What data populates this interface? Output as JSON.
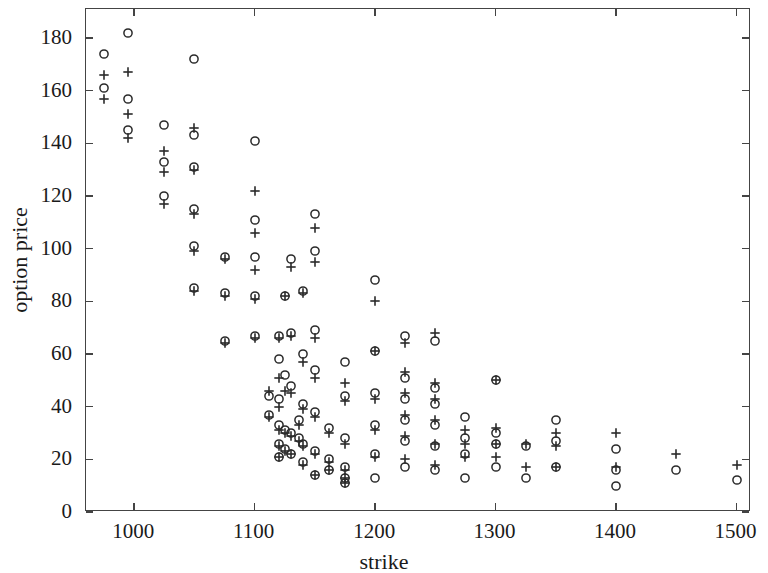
{
  "figure": {
    "background": "#ffffff",
    "axis_color": "#444444",
    "marker_color": "#2a2a2a"
  },
  "chart_data": {
    "type": "scatter",
    "title": "",
    "xlabel": "strike",
    "ylabel": "option price",
    "xlim": [
      960,
      1512
    ],
    "ylim": [
      0,
      191
    ],
    "xticks": [
      1000,
      1100,
      1200,
      1300,
      1400,
      1500
    ],
    "xticklabels": [
      "1000",
      "1100",
      "1200",
      "1300",
      "1400",
      "1500"
    ],
    "yticks": [
      0,
      20,
      40,
      60,
      80,
      100,
      120,
      140,
      160,
      180
    ],
    "yticklabels": [
      "0",
      "20",
      "40",
      "60",
      "80",
      "100",
      "120",
      "140",
      "160",
      "180"
    ],
    "grid": false,
    "legend": null,
    "legend_position": "none",
    "series": [
      {
        "name": "market price",
        "marker": "circle",
        "points": [
          [
            975,
            174
          ],
          [
            975,
            161
          ],
          [
            995,
            182
          ],
          [
            995,
            157
          ],
          [
            995,
            145
          ],
          [
            1025,
            147
          ],
          [
            1025,
            133
          ],
          [
            1025,
            120
          ],
          [
            1050,
            172
          ],
          [
            1050,
            143
          ],
          [
            1050,
            131
          ],
          [
            1050,
            115
          ],
          [
            1050,
            101
          ],
          [
            1050,
            85
          ],
          [
            1075,
            97
          ],
          [
            1075,
            83
          ],
          [
            1075,
            65
          ],
          [
            1100,
            141
          ],
          [
            1100,
            111
          ],
          [
            1100,
            97
          ],
          [
            1100,
            82
          ],
          [
            1100,
            67
          ],
          [
            1112,
            44
          ],
          [
            1112,
            37
          ],
          [
            1120,
            67
          ],
          [
            1120,
            58
          ],
          [
            1120,
            43
          ],
          [
            1120,
            33
          ],
          [
            1120,
            26
          ],
          [
            1120,
            21
          ],
          [
            1125,
            82
          ],
          [
            1125,
            52
          ],
          [
            1125,
            31
          ],
          [
            1125,
            24
          ],
          [
            1130,
            96
          ],
          [
            1130,
            68
          ],
          [
            1130,
            48
          ],
          [
            1130,
            30
          ],
          [
            1130,
            22
          ],
          [
            1137,
            35
          ],
          [
            1137,
            28
          ],
          [
            1140,
            84
          ],
          [
            1140,
            60
          ],
          [
            1140,
            41
          ],
          [
            1140,
            26
          ],
          [
            1140,
            19
          ],
          [
            1150,
            113
          ],
          [
            1150,
            99
          ],
          [
            1150,
            69
          ],
          [
            1150,
            54
          ],
          [
            1150,
            38
          ],
          [
            1150,
            23
          ],
          [
            1150,
            14
          ],
          [
            1162,
            32
          ],
          [
            1162,
            20
          ],
          [
            1162,
            16
          ],
          [
            1175,
            57
          ],
          [
            1175,
            44
          ],
          [
            1175,
            28
          ],
          [
            1175,
            17
          ],
          [
            1175,
            13
          ],
          [
            1175,
            11
          ],
          [
            1200,
            88
          ],
          [
            1200,
            61
          ],
          [
            1200,
            45
          ],
          [
            1200,
            33
          ],
          [
            1200,
            22
          ],
          [
            1200,
            13
          ],
          [
            1225,
            67
          ],
          [
            1225,
            51
          ],
          [
            1225,
            43
          ],
          [
            1225,
            35
          ],
          [
            1225,
            27
          ],
          [
            1225,
            17
          ],
          [
            1250,
            65
          ],
          [
            1250,
            47
          ],
          [
            1250,
            41
          ],
          [
            1250,
            33
          ],
          [
            1250,
            25
          ],
          [
            1250,
            16
          ],
          [
            1275,
            36
          ],
          [
            1275,
            28
          ],
          [
            1275,
            22
          ],
          [
            1275,
            13
          ],
          [
            1300,
            50
          ],
          [
            1300,
            30
          ],
          [
            1300,
            26
          ],
          [
            1300,
            17
          ],
          [
            1325,
            25
          ],
          [
            1325,
            13
          ],
          [
            1350,
            35
          ],
          [
            1350,
            27
          ],
          [
            1350,
            17
          ],
          [
            1400,
            24
          ],
          [
            1400,
            16
          ],
          [
            1400,
            10
          ],
          [
            1450,
            16
          ],
          [
            1500,
            12
          ]
        ]
      },
      {
        "name": "model price",
        "marker": "plus",
        "points": [
          [
            975,
            166
          ],
          [
            975,
            157
          ],
          [
            995,
            167
          ],
          [
            995,
            151
          ],
          [
            995,
            142
          ],
          [
            1025,
            137
          ],
          [
            1025,
            129
          ],
          [
            1025,
            117
          ],
          [
            1050,
            146
          ],
          [
            1050,
            130
          ],
          [
            1050,
            113
          ],
          [
            1050,
            99
          ],
          [
            1050,
            84
          ],
          [
            1075,
            96
          ],
          [
            1075,
            82
          ],
          [
            1075,
            64
          ],
          [
            1100,
            122
          ],
          [
            1100,
            106
          ],
          [
            1100,
            92
          ],
          [
            1100,
            81
          ],
          [
            1100,
            66
          ],
          [
            1112,
            46
          ],
          [
            1112,
            36
          ],
          [
            1120,
            66
          ],
          [
            1120,
            51
          ],
          [
            1120,
            40
          ],
          [
            1120,
            31
          ],
          [
            1120,
            25
          ],
          [
            1120,
            21
          ],
          [
            1125,
            82
          ],
          [
            1125,
            46
          ],
          [
            1125,
            30
          ],
          [
            1125,
            23
          ],
          [
            1130,
            93
          ],
          [
            1130,
            67
          ],
          [
            1130,
            45
          ],
          [
            1130,
            29
          ],
          [
            1130,
            22
          ],
          [
            1137,
            33
          ],
          [
            1137,
            27
          ],
          [
            1140,
            83
          ],
          [
            1140,
            57
          ],
          [
            1140,
            39
          ],
          [
            1140,
            25
          ],
          [
            1140,
            18
          ],
          [
            1150,
            108
          ],
          [
            1150,
            95
          ],
          [
            1150,
            66
          ],
          [
            1150,
            51
          ],
          [
            1150,
            36
          ],
          [
            1150,
            22
          ],
          [
            1150,
            14
          ],
          [
            1162,
            30
          ],
          [
            1162,
            19
          ],
          [
            1162,
            16
          ],
          [
            1175,
            49
          ],
          [
            1175,
            42
          ],
          [
            1175,
            26
          ],
          [
            1175,
            16
          ],
          [
            1175,
            13
          ],
          [
            1175,
            11
          ],
          [
            1200,
            80
          ],
          [
            1200,
            61
          ],
          [
            1200,
            43
          ],
          [
            1200,
            31
          ],
          [
            1200,
            21
          ],
          [
            1225,
            64
          ],
          [
            1225,
            53
          ],
          [
            1225,
            45
          ],
          [
            1225,
            37
          ],
          [
            1225,
            29
          ],
          [
            1225,
            20
          ],
          [
            1250,
            68
          ],
          [
            1250,
            49
          ],
          [
            1250,
            43
          ],
          [
            1250,
            35
          ],
          [
            1250,
            26
          ],
          [
            1250,
            18
          ],
          [
            1275,
            31
          ],
          [
            1275,
            26
          ],
          [
            1275,
            21
          ],
          [
            1300,
            50
          ],
          [
            1300,
            32
          ],
          [
            1300,
            26
          ],
          [
            1300,
            21
          ],
          [
            1325,
            26
          ],
          [
            1325,
            17
          ],
          [
            1350,
            30
          ],
          [
            1350,
            25
          ],
          [
            1350,
            17
          ],
          [
            1400,
            30
          ],
          [
            1400,
            17
          ],
          [
            1450,
            22
          ],
          [
            1500,
            18
          ]
        ]
      }
    ]
  }
}
